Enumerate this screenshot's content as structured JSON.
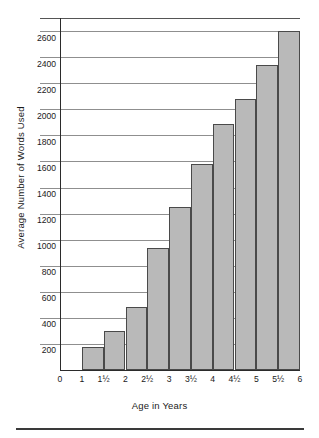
{
  "chart_data": {
    "type": "bar",
    "title": "",
    "xlabel": "Age in Years",
    "ylabel": "Average Number of Words Used",
    "categories": [
      "1½",
      "2",
      "2½",
      "3",
      "3½",
      "4",
      "4½",
      "5",
      "5½",
      "6"
    ],
    "values": [
      175,
      300,
      485,
      940,
      1250,
      1580,
      1890,
      2080,
      2340,
      2600
    ],
    "bar_spans": [
      {
        "from": "1",
        "to": "1½",
        "value": 175
      },
      {
        "from": "1½",
        "to": "2",
        "value": 300
      },
      {
        "from": "2",
        "to": "2½",
        "value": 485
      },
      {
        "from": "2½",
        "to": "3",
        "value": 940
      },
      {
        "from": "3",
        "to": "3½",
        "value": 1250
      },
      {
        "from": "3½",
        "to": "4",
        "value": 1580
      },
      {
        "from": "4",
        "to": "4½",
        "value": 1890
      },
      {
        "from": "4½",
        "to": "5",
        "value": 2080
      },
      {
        "from": "5",
        "to": "5½",
        "value": 2340
      },
      {
        "from": "5½",
        "to": "6",
        "value": 2600
      }
    ],
    "xtick_labels": [
      "0",
      "1",
      "1½",
      "2",
      "2½",
      "3",
      "3½",
      "4",
      "4½",
      "5",
      "5½",
      "6"
    ],
    "ytick_labels": [
      "200",
      "400",
      "600",
      "800",
      "1000",
      "1200",
      "1400",
      "1600",
      "1800",
      "2000",
      "2200",
      "2400",
      "2600"
    ],
    "ylim": [
      0,
      2700
    ],
    "ytick_step": 200,
    "grid": true,
    "legend": null,
    "bar_fill_color": "#b9b9b9",
    "bar_edge_color": "#4a4a4a",
    "gridline_color": "#8f8f8f",
    "axis_color": "#2b2b2b"
  }
}
